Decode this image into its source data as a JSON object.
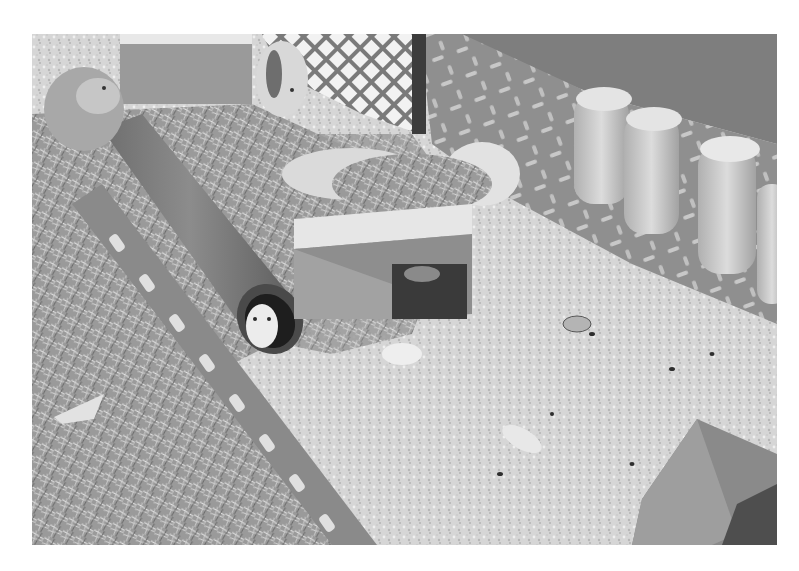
{
  "image": {
    "description": "Grayscale photo of a guinea pig enclosure with hay, wood shavings bedding, a gray pipe tunnel with a guinea pig peeking out, a wooden hideout box topped with hay, two more guinea pigs near the top left, checker-plate metal walls, a perforated metal divider, and a row of upside-down water bottles on the right.",
    "mode": "grayscale",
    "border_color": "#ffffff",
    "subjects": [
      {
        "name": "guinea-pig",
        "location": "top-left corner"
      },
      {
        "name": "guinea-pig",
        "location": "top, behind box"
      },
      {
        "name": "guinea-pig",
        "location": "inside tunnel opening"
      },
      {
        "name": "pipe-tunnel",
        "location": "left-center, diagonal"
      },
      {
        "name": "wooden-hideout",
        "location": "center, topped with hay"
      },
      {
        "name": "water-bottles",
        "count": 4,
        "location": "right side along wall"
      },
      {
        "name": "perforated-divider",
        "location": "lower-left diagonal"
      },
      {
        "name": "checker-plate-wall",
        "location": "top-right"
      },
      {
        "name": "small-box",
        "location": "bottom-right corner"
      },
      {
        "name": "food-pieces",
        "location": "scattered on bedding"
      }
    ]
  }
}
